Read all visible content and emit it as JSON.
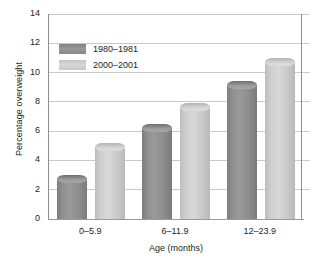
{
  "chart_data": {
    "type": "bar",
    "title": "",
    "xlabel": "Age (months)",
    "ylabel": "Percentage overweight",
    "categories": [
      "0–5.9",
      "6–11.9",
      "12–23.9"
    ],
    "series": [
      {
        "name": "1980–1981",
        "values": [
          3.0,
          6.5,
          9.4
        ],
        "color": "#8f8f8f"
      },
      {
        "name": "2000–2001",
        "values": [
          5.2,
          7.9,
          11.0
        ],
        "color": "#d0d0d0"
      }
    ],
    "ylim": [
      0,
      14
    ],
    "yticks": [
      0,
      2,
      4,
      6,
      8,
      10,
      12,
      14
    ],
    "ytick_labels": [
      "0",
      "2",
      "4",
      "6",
      "8",
      "10",
      "12",
      "14"
    ],
    "grid": true,
    "legend_position": "top-left"
  },
  "legend": {
    "entries": [
      {
        "label": "1980–1981",
        "swatch": "dark-gray-swatch"
      },
      {
        "label": "2000–2001",
        "swatch": "light-gray-swatch"
      }
    ]
  }
}
